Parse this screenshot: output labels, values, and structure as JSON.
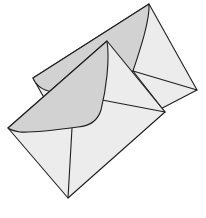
{
  "image": {
    "subject": "Two envelopes illustration",
    "alt_text": "Line drawing of two overlapping envelopes with gray flaps"
  },
  "colors": {
    "background": "#ffffff",
    "envelope_body": "#ececec",
    "envelope_flap": "#d2d2d2",
    "outline": "#1f1f1f"
  },
  "envelopes": [
    {
      "name": "back-envelope",
      "layer": "back"
    },
    {
      "name": "front-envelope",
      "layer": "front"
    }
  ]
}
